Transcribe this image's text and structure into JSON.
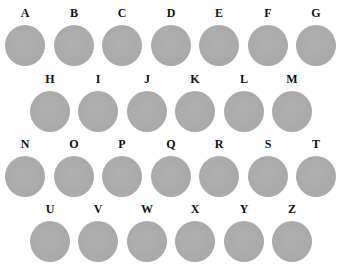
{
  "colors": {
    "background": "#ffffff",
    "circle_fill": "#ababab",
    "label": "#111111"
  },
  "rows": [
    {
      "cells": [
        {
          "letter": "A",
          "x": 1,
          "y": 6
        },
        {
          "letter": "B",
          "x": 50,
          "y": 6
        },
        {
          "letter": "C",
          "x": 98,
          "y": 6
        },
        {
          "letter": "D",
          "x": 147,
          "y": 6
        },
        {
          "letter": "E",
          "x": 195,
          "y": 6
        },
        {
          "letter": "F",
          "x": 244,
          "y": 6
        },
        {
          "letter": "G",
          "x": 292,
          "y": 6
        }
      ]
    },
    {
      "cells": [
        {
          "letter": "H",
          "x": 26,
          "y": 72
        },
        {
          "letter": "I",
          "x": 74,
          "y": 72
        },
        {
          "letter": "J",
          "x": 123,
          "y": 72
        },
        {
          "letter": "K",
          "x": 171,
          "y": 72
        },
        {
          "letter": "L",
          "x": 220,
          "y": 72
        },
        {
          "letter": "M",
          "x": 268,
          "y": 72
        }
      ]
    },
    {
      "cells": [
        {
          "letter": "N",
          "x": 1,
          "y": 137
        },
        {
          "letter": "O",
          "x": 50,
          "y": 137
        },
        {
          "letter": "P",
          "x": 98,
          "y": 137
        },
        {
          "letter": "Q",
          "x": 147,
          "y": 137
        },
        {
          "letter": "R",
          "x": 195,
          "y": 137
        },
        {
          "letter": "S",
          "x": 244,
          "y": 137
        },
        {
          "letter": "T",
          "x": 292,
          "y": 137
        }
      ]
    },
    {
      "cells": [
        {
          "letter": "U",
          "x": 26,
          "y": 202
        },
        {
          "letter": "V",
          "x": 74,
          "y": 202
        },
        {
          "letter": "W",
          "x": 123,
          "y": 202
        },
        {
          "letter": "X",
          "x": 171,
          "y": 202
        },
        {
          "letter": "Y",
          "x": 220,
          "y": 202
        },
        {
          "letter": "Z",
          "x": 268,
          "y": 202
        }
      ]
    }
  ]
}
